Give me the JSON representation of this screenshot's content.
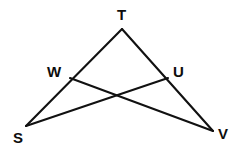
{
  "figure": {
    "shape_type": "geometry-diagram",
    "background_color": "#ffffff",
    "stroke_color": "#111111",
    "label_color": "#0d0d0d",
    "canvas": {
      "width": 234,
      "height": 151
    },
    "points": {
      "T": {
        "label": "T",
        "x": 122,
        "y": 29
      },
      "W": {
        "label": "W",
        "x": 70,
        "y": 78
      },
      "U": {
        "label": "U",
        "x": 168,
        "y": 78
      },
      "S": {
        "label": "S",
        "x": 26,
        "y": 126
      },
      "V": {
        "label": "V",
        "x": 213,
        "y": 131
      },
      "X": {
        "label": "",
        "x": 118,
        "y": 96
      }
    },
    "segments": [
      {
        "name": "side-T-S",
        "from": "T",
        "to": "S"
      },
      {
        "name": "side-T-V",
        "from": "T",
        "to": "V"
      },
      {
        "name": "cevian-W-V",
        "from": "W",
        "to": "V"
      },
      {
        "name": "cevian-U-S",
        "from": "U",
        "to": "S"
      }
    ],
    "labels": [
      {
        "name": "vertex-label-T",
        "text": "T"
      },
      {
        "name": "vertex-label-W",
        "text": "W"
      },
      {
        "name": "vertex-label-U",
        "text": "U"
      },
      {
        "name": "vertex-label-S",
        "text": "S"
      },
      {
        "name": "vertex-label-V",
        "text": "V"
      }
    ]
  }
}
